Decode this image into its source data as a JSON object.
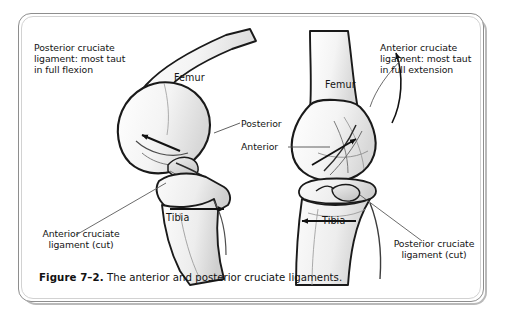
{
  "figure": {
    "caption_number": "Figure 7–2.",
    "caption_text": "The anterior and posterior cruciate ligaments.",
    "border_color": "#8e8e8e",
    "background_color": "#ffffff",
    "ink_color": "#141414"
  },
  "labels": {
    "top_left": "Posterior cruciate\nligament: most taut\nin full flexion",
    "top_right": "Anterior cruciate\nligament: most taut\nin full extension",
    "bottom_left": "Anterior cruciate\nligament (cut)",
    "bottom_right": "Posterior cruciate\nligament (cut)",
    "center_upper": "Posterior",
    "center_lower": "Anterior"
  },
  "bones": {
    "left_femur": "Femur",
    "left_tibia": "Tibia",
    "right_femur": "Femur",
    "right_tibia": "Tibia"
  },
  "illustrations": [
    {
      "name": "knee-flexed-left",
      "position": "left",
      "description": "Knee in flexion, lateral oblique view",
      "arrow_directions": [
        "up-left",
        "right"
      ]
    },
    {
      "name": "knee-extended-right",
      "position": "right",
      "description": "Knee in extension, anterior view",
      "arrow_directions": [
        "up-right",
        "left",
        "curved-up"
      ]
    }
  ]
}
